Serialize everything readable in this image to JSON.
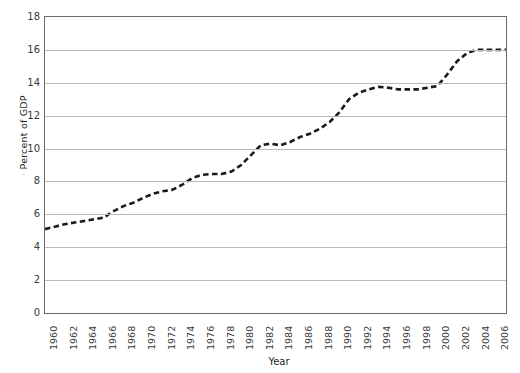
{
  "chart_data": {
    "type": "line",
    "title": "",
    "xlabel": "Year",
    "ylabel": "Percent of GDP",
    "ylim": [
      0,
      18
    ],
    "ytick_step": 2,
    "yticks": [
      18,
      16,
      14,
      12,
      10,
      8,
      6,
      4,
      2,
      0
    ],
    "xlim": [
      1960,
      2007
    ],
    "xticks": [
      1960,
      1962,
      1964,
      1966,
      1968,
      1970,
      1972,
      1974,
      1976,
      1978,
      1980,
      1982,
      1984,
      1986,
      1988,
      1990,
      1992,
      1994,
      1996,
      1998,
      2000,
      2002,
      2004,
      2006
    ],
    "grid": "horizontal",
    "legend": "none",
    "line_style": "dashed",
    "line_color": "#1a1a1a",
    "line_width": 2.6,
    "x": [
      1960,
      1961,
      1962,
      1963,
      1964,
      1965,
      1966,
      1967,
      1968,
      1969,
      1970,
      1971,
      1972,
      1973,
      1974,
      1975,
      1976,
      1977,
      1978,
      1979,
      1980,
      1981,
      1982,
      1983,
      1984,
      1985,
      1986,
      1987,
      1988,
      1989,
      1990,
      1991,
      1992,
      1993,
      1994,
      1995,
      1996,
      1997,
      1998,
      1999,
      2000,
      2001,
      2002,
      2003,
      2004,
      2005,
      2006,
      2007
    ],
    "values": [
      5.1,
      5.25,
      5.4,
      5.5,
      5.6,
      5.7,
      5.8,
      6.2,
      6.5,
      6.7,
      7.0,
      7.25,
      7.4,
      7.5,
      7.8,
      8.2,
      8.4,
      8.45,
      8.45,
      8.6,
      9.0,
      9.6,
      10.2,
      10.3,
      10.2,
      10.4,
      10.7,
      10.9,
      11.2,
      11.6,
      12.2,
      13.0,
      13.4,
      13.6,
      13.75,
      13.7,
      13.6,
      13.6,
      13.6,
      13.7,
      13.8,
      14.5,
      15.3,
      15.8,
      16.0,
      16.0,
      16.0,
      16.0
    ],
    "series_name": "Health expenditure"
  },
  "axis": {
    "ylabel_text": "Percent of GDP",
    "ylabel_prefix": "·",
    "xlabel_text": "Year"
  }
}
